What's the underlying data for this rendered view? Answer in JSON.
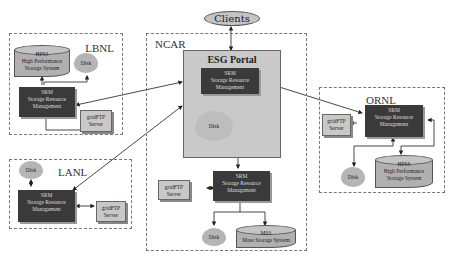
{
  "diagram": {
    "clients": {
      "label": "Clients"
    },
    "groups": {
      "lbnl": {
        "label": "LBNL",
        "srm": {
          "title": "SRM",
          "line1": "Storage Resource",
          "line2": "Management"
        },
        "hpss": {
          "title": "HPSS",
          "line1": "High Performance",
          "line2": "Storage System"
        },
        "disk": {
          "label": "Disk"
        },
        "gridftp": {
          "line1": "gridFTP",
          "line2": "Server"
        }
      },
      "lanl": {
        "label": "LANL",
        "srm": {
          "title": "SRM",
          "line1": "Storage Resource",
          "line2": "Management"
        },
        "disk": {
          "label": "Disk"
        },
        "gridftp": {
          "line1": "gridFTP",
          "line2": "Server"
        }
      },
      "ncar": {
        "label": "NCAR",
        "portal": {
          "label": "ESG Portal",
          "srm": {
            "title": "SRM",
            "line1": "Storage Resource",
            "line2": "Management"
          },
          "disk": {
            "label": "Disk"
          }
        },
        "srm": {
          "title": "SRM",
          "line1": "Storage Resource",
          "line2": "Management"
        },
        "gridftp": {
          "line1": "gridFTP",
          "line2": "Server"
        },
        "disk": {
          "label": "Disk"
        },
        "mss": {
          "title": "MSS",
          "line1": "Mass Storage System"
        }
      },
      "ornl": {
        "label": "ORNL",
        "srm": {
          "title": "SRM",
          "line1": "Storage Resource",
          "line2": "Management"
        },
        "gridftp": {
          "line1": "gridFTP",
          "line2": "Server"
        },
        "disk": {
          "label": "Disk"
        },
        "hpss": {
          "title": "HPSS",
          "line1": "High Performance",
          "line2": "Storage System"
        }
      }
    },
    "colors": {
      "srm_fill": "#3a3a3a",
      "portal_fill": "#c9c9c9",
      "node_fill": "#b5b5b5",
      "line": "#333333"
    }
  }
}
